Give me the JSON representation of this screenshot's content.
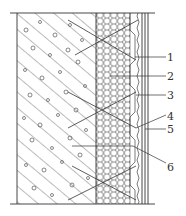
{
  "diagram": {
    "type": "wall-insulation-cross-section",
    "colors": {
      "line": "#3a3a3a",
      "background": "#ffffff"
    },
    "layers": [
      {
        "id": "base-wall",
        "pattern": "concrete-hatch"
      },
      {
        "id": "insulation-board",
        "pattern": "honeycomb"
      },
      {
        "id": "bonding-mortar",
        "pattern": "wavy"
      },
      {
        "id": "finish-lines",
        "pattern": "parallel-lines"
      }
    ],
    "callouts": [
      {
        "label": "1",
        "y": 57
      },
      {
        "label": "2",
        "y": 76
      },
      {
        "label": "3",
        "y": 95
      },
      {
        "label": "4",
        "y": 117
      },
      {
        "label": "5",
        "y": 129
      },
      {
        "label": "6",
        "y": 167
      }
    ]
  }
}
